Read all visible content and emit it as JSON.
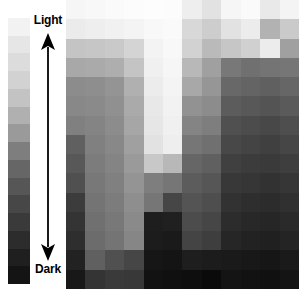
{
  "figure": {
    "width": 299,
    "height": 289
  },
  "scale": {
    "top_label": "Light",
    "bottom_label": "Dark",
    "arrow_name": "double-headed-vertical-arrow",
    "arrow_color": "#1a1a1a",
    "ramp_name": "grayscale-ramp-bar",
    "ramp_steps": [
      "#f2f2f2",
      "#e6e6e6",
      "#dcdcdc",
      "#d2d2d2",
      "#c3c3c3",
      "#b0b0b0",
      "#9a9a9a",
      "#7e7e7e",
      "#666666",
      "#565656",
      "#474747",
      "#3a3a3a",
      "#2c2c2c",
      "#1f1f1f",
      "#141414"
    ]
  },
  "chart_data": {
    "type": "heatmap",
    "subtitle": "",
    "xlabel": "",
    "ylabel": "",
    "legend_position": "left",
    "grid": false,
    "colormap": "grayscale",
    "value_range": [
      0,
      255
    ],
    "value_meaning": "8-bit luminance; 255 = Light, 0 = Dark",
    "columns": 12,
    "rows": 15,
    "annotations": [
      "Light",
      "Dark"
    ],
    "values": [
      [
        246,
        248,
        250,
        252,
        253,
        252,
        238,
        226,
        246,
        250,
        233,
        244
      ],
      [
        235,
        238,
        241,
        244,
        248,
        250,
        216,
        205,
        226,
        236,
        178,
        202
      ],
      [
        196,
        198,
        201,
        212,
        243,
        248,
        210,
        186,
        198,
        208,
        236,
        160
      ],
      [
        168,
        170,
        174,
        196,
        240,
        246,
        184,
        160,
        120,
        112,
        116,
        118
      ],
      [
        140,
        142,
        148,
        176,
        236,
        244,
        168,
        150,
        104,
        100,
        96,
        102
      ],
      [
        136,
        138,
        144,
        170,
        232,
        242,
        146,
        140,
        92,
        88,
        84,
        90
      ],
      [
        128,
        132,
        140,
        166,
        230,
        240,
        132,
        126,
        80,
        76,
        72,
        78
      ],
      [
        96,
        128,
        136,
        160,
        226,
        238,
        118,
        112,
        72,
        68,
        64,
        70
      ],
      [
        88,
        124,
        132,
        154,
        200,
        184,
        102,
        96,
        64,
        60,
        58,
        62
      ],
      [
        80,
        120,
        128,
        148,
        126,
        118,
        92,
        86,
        56,
        54,
        50,
        54
      ],
      [
        60,
        116,
        124,
        142,
        118,
        70,
        84,
        78,
        50,
        46,
        44,
        48
      ],
      [
        52,
        112,
        120,
        138,
        30,
        32,
        76,
        70,
        44,
        40,
        38,
        42
      ],
      [
        46,
        108,
        116,
        134,
        28,
        26,
        68,
        62,
        38,
        34,
        32,
        36
      ],
      [
        34,
        96,
        80,
        70,
        22,
        20,
        30,
        28,
        26,
        24,
        22,
        26
      ],
      [
        24,
        52,
        58,
        56,
        18,
        16,
        14,
        10,
        20,
        18,
        16,
        20
      ]
    ]
  }
}
